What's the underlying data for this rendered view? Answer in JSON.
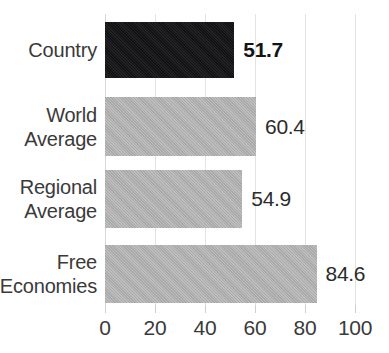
{
  "chart_data": {
    "type": "bar",
    "orientation": "horizontal",
    "title": "",
    "xlabel": "",
    "ylabel": "",
    "xlim": [
      0,
      100
    ],
    "grid": true,
    "legend": "none",
    "categories": [
      "Country",
      "World\nAverage",
      "Regional\nAverage",
      "Free\nEconomies"
    ],
    "values": [
      51.7,
      60.4,
      54.9,
      84.6
    ],
    "value_labels": [
      "51.7",
      "60.4",
      "54.9",
      "84.6"
    ],
    "xticks": [
      0,
      20,
      40,
      60,
      80,
      100
    ],
    "xtick_labels": [
      "0",
      "20",
      "40",
      "60",
      "80",
      "100"
    ],
    "bar_colors": [
      "#17171a",
      "#b2b2b2",
      "#b2b2b2",
      "#b2b2b2"
    ],
    "highlight_index": 0,
    "bold_label_index": 0
  },
  "colors": {
    "highlight_bar": "#17171a",
    "default_bar": "#b2b2b2",
    "gridline": "#e3e3e3",
    "text": "#3a3a3a",
    "background": "#ffffff"
  },
  "title_strip": {
    "text": ""
  }
}
